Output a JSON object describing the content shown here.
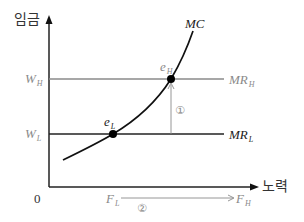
{
  "diagram": {
    "y_axis_label": "임금",
    "x_axis_label": "노력",
    "origin_label": "0",
    "wage_levels": [
      {
        "id": "high",
        "label_main": "W",
        "label_sub": "H",
        "curve_main": "MR",
        "curve_sub": "H",
        "color": "#8a8a8a"
      },
      {
        "id": "low",
        "label_main": "W",
        "label_sub": "L",
        "curve_main": "MR",
        "curve_sub": "L",
        "color": "#222222"
      }
    ],
    "mc_curve_label": "MC",
    "equilibria": [
      {
        "id": "eH",
        "label_main": "e",
        "label_sub": "H"
      },
      {
        "id": "eL",
        "label_main": "e",
        "label_sub": "L"
      }
    ],
    "effort_levels": {
      "low_main": "F",
      "low_sub": "L",
      "high_main": "F",
      "high_sub": "H"
    },
    "annotations": {
      "wage_increase_marker": "①",
      "effort_increase_marker": "②"
    },
    "colors": {
      "axis": "#222222",
      "mc_curve": "#111111",
      "mr_high": "#8a8a8a",
      "mr_low": "#222222",
      "arrow_gray": "#8a8a8a"
    }
  }
}
